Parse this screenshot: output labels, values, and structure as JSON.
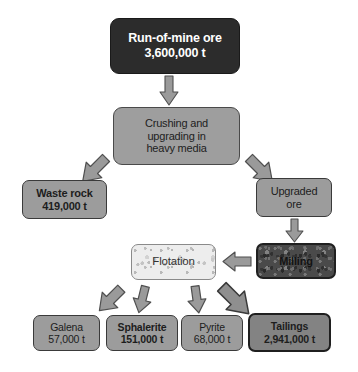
{
  "diagram": {
    "background_color": "#ffffff",
    "nodes": {
      "run_of_mine": {
        "line1": "Run-of-mine ore",
        "line2": "3,600,000 t",
        "fill": "#2c2c2c",
        "text_color": "#ffffff"
      },
      "crushing": {
        "line1": "Crushing and",
        "line2": "upgrading in",
        "line3": "heavy media",
        "fill": "#9e9e9e",
        "text_color": "#1d1d1d"
      },
      "waste_rock": {
        "line1": "Waste rock",
        "line2": "419,000 t",
        "fill": "#9c9c9c",
        "text_color": "#1d1d1d"
      },
      "upgraded_ore": {
        "line1": "Upgraded",
        "line2": "ore",
        "fill": "#9c9c9c",
        "text_color": "#1d1d1d"
      },
      "milling": {
        "line1": "Milling",
        "fill": "#4a4a4a",
        "text_color": "#131313"
      },
      "flotation": {
        "line1": "Flotation",
        "fill": "#ededed",
        "text_color": "#333333"
      },
      "galena": {
        "line1": "Galena",
        "line2": "57,000 t",
        "fill": "#9c9c9c",
        "text_color": "#1d1d1d"
      },
      "sphalerite": {
        "line1": "Sphalerite",
        "line2": "151,000 t",
        "fill": "#9c9c9c",
        "text_color": "#1d1d1d"
      },
      "pyrite": {
        "line1": "Pyrite",
        "line2": "68,000 t",
        "fill": "#9c9c9c",
        "text_color": "#1d1d1d"
      },
      "tailings": {
        "line1": "Tailings",
        "line2": "2,941,000 t",
        "fill": "#838383",
        "text_color": "#1d1d1d"
      }
    },
    "arrows": {
      "rom_to_crushing": "arrow-down",
      "crushing_to_waste_rock": "arrow-down-left",
      "crushing_to_upgraded_ore": "arrow-down-right",
      "upgraded_ore_to_milling": "arrow-down",
      "milling_to_flotation": "arrow-left",
      "flotation_to_galena": "arrow-down-left",
      "flotation_to_sphalerite": "arrow-down",
      "flotation_to_pyrite": "arrow-down",
      "flotation_to_tailings": "arrow-down-right"
    },
    "arrow_style": {
      "fill": "#9a9a9a",
      "stroke": "#4f4f4f"
    }
  }
}
